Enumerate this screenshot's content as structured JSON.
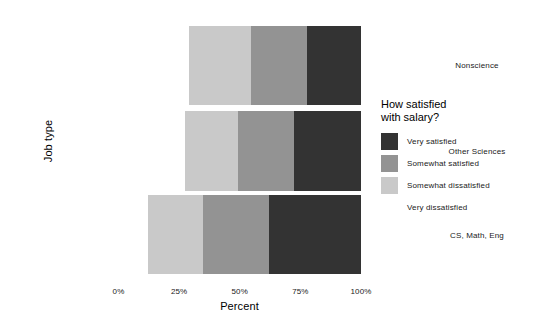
{
  "chart_data": {
    "type": "bar",
    "orientation": "horizontal",
    "stacked": true,
    "normalized": true,
    "title": "",
    "xlabel": "Percent",
    "ylabel": "Job type",
    "xlim": [
      0,
      100
    ],
    "grid": false,
    "legend_position": "right",
    "legend_title_line1": "How satisfied",
    "legend_title_line2": "with salary?",
    "categories": [
      "Nonscience",
      "Other Sciences",
      "CS, Math, Eng"
    ],
    "xticks": [
      "0%",
      "25%",
      "50%",
      "75%",
      "100%"
    ],
    "xtick_values": [
      0,
      25,
      50,
      75,
      100
    ],
    "series": [
      {
        "name": "Very dissatisfied",
        "color": "#ffffff",
        "values": [
          29.1,
          27.3,
          12.2
        ]
      },
      {
        "name": "Somewhat dissatisfied",
        "color": "#c9c9c9",
        "values": [
          25.5,
          22.0,
          22.6
        ]
      },
      {
        "name": "Somewhat satisfied",
        "color": "#939393",
        "values": [
          23.1,
          23.1,
          27.3
        ]
      },
      {
        "name": "Very satisfied",
        "color": "#333333",
        "values": [
          22.3,
          27.6,
          37.9
        ]
      }
    ],
    "legend_entries": [
      {
        "label": "Very satisfied",
        "color": "#333333"
      },
      {
        "label": "Somewhat satisfied",
        "color": "#939393"
      },
      {
        "label": "Somewhat dissatisfied",
        "color": "#c9c9c9"
      },
      {
        "label": "Very dissatisfied",
        "color": "#ffffff"
      }
    ]
  }
}
